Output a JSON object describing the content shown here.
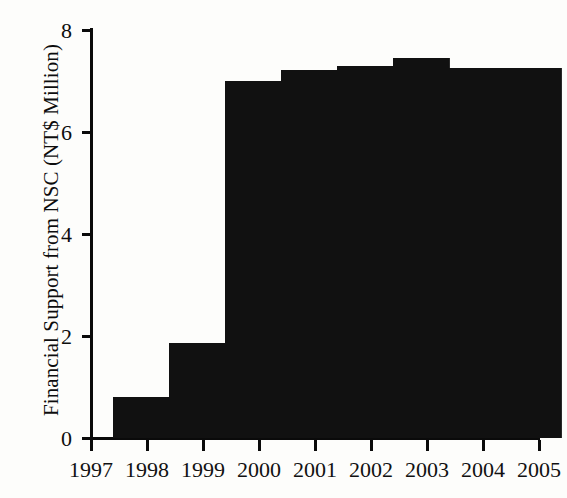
{
  "chart_data": {
    "type": "bar",
    "title": "",
    "subtitle": "",
    "xlabel": "",
    "ylabel": "Financial Support from NSC (NT$ Million)",
    "categories": [
      "1997",
      "1998",
      "1999",
      "2000",
      "2001",
      "2002",
      "2003",
      "2004"
    ],
    "values": [
      0.8,
      1.87,
      7.0,
      7.22,
      7.29,
      7.45,
      7.25,
      7.25
    ],
    "series": [
      {
        "name": "Financial Support from NSC",
        "values": [
          0.8,
          1.87,
          7.0,
          7.22,
          7.29,
          7.45,
          7.25,
          7.25
        ]
      }
    ],
    "ylim": [
      0,
      8
    ],
    "yticks": [
      0,
      2,
      4,
      6,
      8
    ],
    "ytick_labels": [
      "0",
      "2",
      "4",
      "6",
      "8"
    ],
    "xlim": [
      "1997",
      "2005"
    ],
    "xticks": [
      "1997",
      "1998",
      "1999",
      "2000",
      "2001",
      "2002",
      "2003",
      "2004",
      "2005"
    ],
    "xtick_labels": [
      "1997",
      "1998",
      "1999",
      "2000",
      "2001",
      "2002",
      "2003",
      "2004",
      "2005"
    ],
    "grid": false,
    "legend": false,
    "legend_position": "none",
    "bar_color": "#111111",
    "axis_color": "#0a0a0a",
    "background_color": "#fdfdfb"
  }
}
